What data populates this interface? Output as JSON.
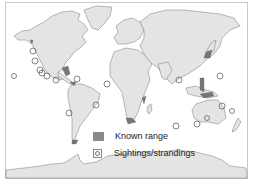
{
  "map": {
    "type": "world distribution map",
    "colors": {
      "land": "#e4e4e4",
      "coastline": "#777777",
      "known_range": "#777777",
      "sighting_marker": "#666666",
      "frame": "#c8c8c8"
    }
  },
  "legend": {
    "items": [
      {
        "label": "Known range",
        "symbol": "filled-gray-square"
      },
      {
        "label": "Sightings/strandings",
        "symbol": "open-circle"
      }
    ]
  },
  "sightings": [
    {
      "x": 33,
      "y": 51
    },
    {
      "x": 35,
      "y": 61
    },
    {
      "x": 40,
      "y": 70
    },
    {
      "x": 42,
      "y": 73
    },
    {
      "x": 47,
      "y": 76
    },
    {
      "x": 14,
      "y": 76
    },
    {
      "x": 56,
      "y": 80
    },
    {
      "x": 77,
      "y": 79
    },
    {
      "x": 107,
      "y": 84
    },
    {
      "x": 69,
      "y": 113
    },
    {
      "x": 96,
      "y": 105
    },
    {
      "x": 179,
      "y": 80
    },
    {
      "x": 220,
      "y": 76
    },
    {
      "x": 222,
      "y": 106
    },
    {
      "x": 207,
      "y": 118
    },
    {
      "x": 197,
      "y": 124
    },
    {
      "x": 176,
      "y": 126
    },
    {
      "x": 232,
      "y": 111
    }
  ]
}
